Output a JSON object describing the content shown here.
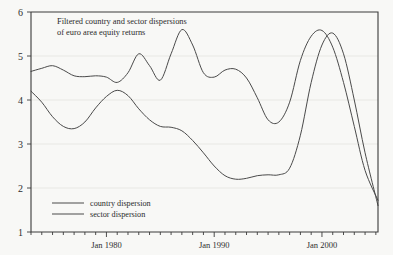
{
  "chart_data": {
    "type": "line",
    "title": "Filtered country and sector dispersions of euro area equity returns",
    "title_line1": "Filtered country and sector dispersions",
    "title_line2": "of euro area equity returns",
    "xlabel": "",
    "ylabel": "",
    "ylim": [
      1,
      6
    ],
    "xlim": [
      1973.0,
      2005.2
    ],
    "grid": true,
    "grid_orientation": "horizontal",
    "legend_position": "bottom-left",
    "y_ticks": [
      1,
      2,
      3,
      4,
      5,
      6
    ],
    "y_tick_labels": [
      "1",
      "2",
      "3",
      "4",
      "5",
      "6"
    ],
    "x_tick_labels": [
      "Jan 1980",
      "Jan 1990",
      "Jan 2000"
    ],
    "x_tick_values": [
      1980,
      1990,
      2000
    ],
    "x_minor_tick_interval_years": 1,
    "line_color": "#4a4a4a",
    "background_color": "#f8f8f6",
    "axis_color": "#3a3a3a",
    "series": [
      {
        "name": "country dispersion",
        "x": [
          1973.0,
          1974.0,
          1975.0,
          1976.0,
          1977.0,
          1978.0,
          1979.0,
          1980.0,
          1981.0,
          1982.0,
          1983.0,
          1984.0,
          1985.0,
          1986.0,
          1987.0,
          1988.0,
          1989.0,
          1990.0,
          1991.0,
          1992.0,
          1993.0,
          1994.0,
          1995.0,
          1996.0,
          1997.0,
          1998.0,
          1999.0,
          2000.0,
          2001.0,
          2002.0,
          2003.0,
          2004.0,
          2005.2
        ],
        "values": [
          4.65,
          4.72,
          4.78,
          4.68,
          4.55,
          4.53,
          4.55,
          4.52,
          4.4,
          4.62,
          5.05,
          4.78,
          4.45,
          5.05,
          5.6,
          5.25,
          4.62,
          4.52,
          4.68,
          4.7,
          4.5,
          4.05,
          3.55,
          3.5,
          3.95,
          4.9,
          5.45,
          5.58,
          5.2,
          4.4,
          3.4,
          2.4,
          1.72
        ]
      },
      {
        "name": "sector dispersion",
        "x": [
          1973.0,
          1974.0,
          1975.0,
          1976.0,
          1977.0,
          1978.0,
          1979.0,
          1980.0,
          1981.0,
          1982.0,
          1983.0,
          1984.0,
          1985.0,
          1986.0,
          1987.0,
          1988.0,
          1989.0,
          1990.0,
          1991.0,
          1992.0,
          1993.0,
          1994.0,
          1995.0,
          1996.0,
          1997.0,
          1998.0,
          1999.0,
          2000.0,
          2001.0,
          2002.0,
          2003.0,
          2004.0,
          2005.2
        ],
        "values": [
          4.2,
          3.95,
          3.62,
          3.4,
          3.35,
          3.5,
          3.82,
          4.08,
          4.22,
          4.1,
          3.8,
          3.55,
          3.4,
          3.38,
          3.3,
          3.08,
          2.8,
          2.5,
          2.28,
          2.2,
          2.22,
          2.28,
          2.3,
          2.3,
          2.45,
          3.2,
          4.4,
          5.25,
          5.52,
          5.05,
          4.0,
          2.8,
          1.6
        ]
      }
    ],
    "annotations": []
  },
  "legend": {
    "items": [
      {
        "label": "country dispersion"
      },
      {
        "label": "sector dispersion"
      }
    ]
  }
}
